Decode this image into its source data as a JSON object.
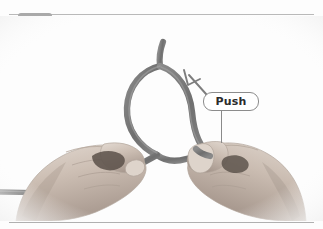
{
  "page": {
    "background_color": "#fdfdfd",
    "width": 323,
    "height": 229
  },
  "rules": {
    "top_color": "#b9b9b9",
    "bottom_color": "#b0b0b0"
  },
  "step_badge": {
    "number": "3",
    "background_color": "#a9a9a9",
    "text_color": "#fbfbfb"
  },
  "photo": {
    "description": "Two hands holding a gray rope formed into a loop, grayscale instructional photograph",
    "rope_color": "#7b7b7b",
    "skin_color": "#cfc3b8",
    "subjects": [
      "left-hand",
      "right-hand",
      "rope-loop",
      "rope-tail"
    ]
  },
  "annotations": {
    "arrow": {
      "name": "push-direction-arrow",
      "direction": "up-left",
      "color": "#7d7d7d"
    },
    "callout": {
      "label": "Push",
      "border_color": "#8c8c8c",
      "background_color": "#ffffff",
      "text_color": "#2b2b2b"
    },
    "leader_line": {
      "color": "#8a8a8a"
    }
  }
}
